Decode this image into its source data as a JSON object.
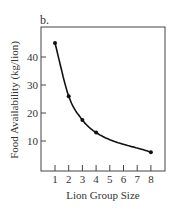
{
  "chart_data": {
    "type": "line",
    "panel_label": "b.",
    "title": "",
    "xlabel": "Lion Group Size",
    "ylabel": "Food Availability (kg/lion)",
    "x_ticks": [
      "1",
      "2",
      "3",
      "4",
      "5",
      "6",
      "7",
      "8"
    ],
    "y_ticks": [
      "10",
      "20",
      "30",
      "40"
    ],
    "xlim": [
      0,
      8.5
    ],
    "ylim": [
      0,
      50
    ],
    "grid": false,
    "legend": null,
    "series": [
      {
        "name": "Food Availability",
        "style": "smooth curve with markers",
        "x": [
          1,
          2,
          3,
          4,
          8
        ],
        "y": [
          45,
          26,
          17.5,
          13,
          6
        ]
      }
    ]
  }
}
